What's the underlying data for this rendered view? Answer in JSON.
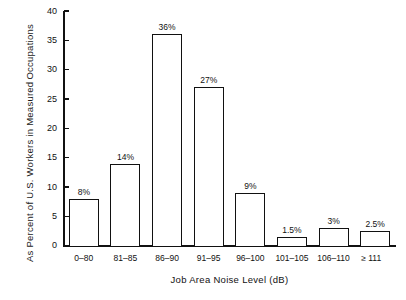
{
  "chart_data": {
    "type": "bar",
    "title": "",
    "xlabel": "Job Area Noise Level (dB)",
    "ylabel_line1": "As Percent of U.S. Workers in Measured",
    "ylabel_line2": "Occupations",
    "categories": [
      "0–80",
      "81–85",
      "86–90",
      "91–95",
      "96–100",
      "101–105",
      "106–110",
      "≥ 111"
    ],
    "values": [
      8,
      14,
      36,
      27,
      9,
      1.5,
      3,
      2.5
    ],
    "value_labels": [
      "8%",
      "14%",
      "36%",
      "27%",
      "9%",
      "1.5%",
      "3%",
      "2.5%"
    ],
    "ylim": [
      0,
      40
    ],
    "yticks": [
      0,
      5,
      10,
      15,
      20,
      25,
      30,
      35,
      40
    ],
    "ytick_labels": [
      "0",
      "5",
      "10",
      "15",
      "20",
      "25",
      "30",
      "35",
      "40"
    ],
    "grid": false,
    "legend": "none",
    "bar_fill_color": "#ffffff",
    "bar_edge_color": "#111111",
    "axis_color": "#111111"
  },
  "caption": {
    "text": ""
  }
}
